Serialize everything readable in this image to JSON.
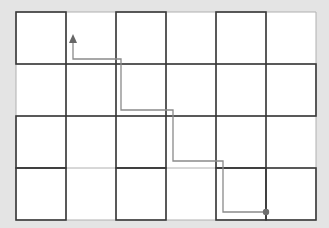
{
  "diagram": {
    "grid": {
      "cols": 6,
      "rows": 4,
      "origin_x": 16,
      "origin_y": 12,
      "cell_w": 50,
      "cell_h": 52
    },
    "colors": {
      "background": "#e4e4e4",
      "cell": "#ffffff",
      "light_line": "#b0b0b0",
      "dark_line": "#3a3a3a",
      "path": "#8a8a8a",
      "endpoint": "#6e6e6e"
    },
    "dark_cells": [
      [
        0,
        0
      ],
      [
        0,
        2
      ],
      [
        0,
        4
      ],
      [
        1,
        1
      ],
      [
        1,
        3
      ],
      [
        1,
        5
      ],
      [
        2,
        0
      ],
      [
        2,
        2
      ],
      [
        2,
        4
      ],
      [
        3,
        0
      ],
      [
        3,
        2
      ],
      [
        3,
        4
      ],
      [
        3,
        5
      ]
    ],
    "path": {
      "points": [
        [
          73,
          40
        ],
        [
          73,
          59
        ],
        [
          121,
          59
        ],
        [
          121,
          110
        ],
        [
          173,
          110
        ],
        [
          173,
          161
        ],
        [
          223,
          161
        ],
        [
          223,
          212
        ],
        [
          266,
          212
        ]
      ],
      "start": {
        "label": "end-dot",
        "x": 266,
        "y": 212
      },
      "end": {
        "label": "arrowhead",
        "x": 73,
        "y": 37
      }
    }
  }
}
